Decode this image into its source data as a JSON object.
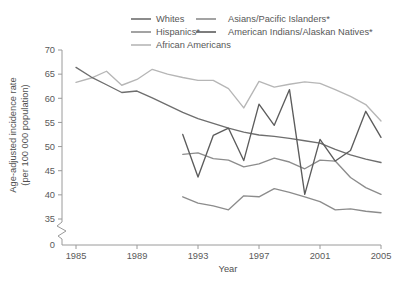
{
  "chart_data": {
    "type": "line",
    "title": "",
    "xlabel": "Year",
    "ylabel": "Age-adjusted incidence rate (per 100 000 population)",
    "ylabel_line1": "Age-adjusted incidence rate",
    "ylabel_line2": "(per 100 000 population)",
    "x": [
      1985,
      1986,
      1987,
      1988,
      1989,
      1990,
      1991,
      1992,
      1993,
      1994,
      1995,
      1996,
      1997,
      1998,
      1999,
      2000,
      2001,
      2002,
      2003,
      2004,
      2005
    ],
    "xlim": [
      1985,
      2005
    ],
    "ylim": [
      34,
      70
    ],
    "xticks": [
      1985,
      1989,
      1993,
      1997,
      2001,
      2005
    ],
    "xtick_labels": [
      "1985",
      "1989",
      "1993",
      "1997",
      "2001",
      "2005"
    ],
    "yticks": [
      35,
      40,
      45,
      50,
      55,
      60,
      65,
      70
    ],
    "ytick_labels": [
      "35",
      "40",
      "45",
      "50",
      "55",
      "60",
      "65",
      "70"
    ],
    "y_zero_label": "0",
    "axis_break": true,
    "grid": false,
    "legend_position": "top",
    "series": [
      {
        "name": "Whites",
        "color": "#6e6e6e",
        "x": [
          1985,
          1986,
          1987,
          1988,
          1989,
          1990,
          1991,
          1992,
          1993,
          1994,
          1995,
          1996,
          1997,
          1998,
          1999,
          2000,
          2001,
          2002,
          2003,
          2004,
          2005
        ],
        "values": [
          66.4,
          64.4,
          62.8,
          61.2,
          61.5,
          60.1,
          58.6,
          57.1,
          55.8,
          54.8,
          53.8,
          53.0,
          52.4,
          52.1,
          51.7,
          51.2,
          50.7,
          49.4,
          48.3,
          47.4,
          46.7
        ]
      },
      {
        "name": "African Americans",
        "color": "#b6b6b6",
        "x": [
          1985,
          1986,
          1987,
          1988,
          1989,
          1990,
          1991,
          1992,
          1993,
          1994,
          1995,
          1996,
          1997,
          1998,
          1999,
          2000,
          2001,
          2002,
          2003,
          2004,
          2005
        ],
        "values": [
          63.3,
          64.2,
          65.6,
          62.7,
          63.9,
          66.0,
          65.0,
          64.3,
          63.7,
          63.7,
          62.0,
          58.0,
          63.5,
          62.3,
          62.9,
          63.4,
          63.1,
          61.8,
          60.4,
          58.7,
          55.3
        ]
      },
      {
        "name": "Hispanics*",
        "color": "#8c8c8c",
        "x": [
          1992,
          1993,
          1994,
          1995,
          1996,
          1997,
          1998,
          1999,
          2000,
          2001,
          2002,
          2003,
          2004,
          2005
        ],
        "values": [
          48.4,
          48.7,
          47.5,
          47.2,
          45.8,
          46.4,
          47.6,
          46.8,
          45.4,
          47.2,
          47.0,
          43.6,
          41.5,
          40.1
        ]
      },
      {
        "name": "Asians/Pacific Islanders*",
        "color": "#8c8c8c",
        "x": [
          1992,
          1993,
          1994,
          1995,
          1996,
          1997,
          1998,
          1999,
          2000,
          2001,
          2002,
          2003,
          2004,
          2005
        ],
        "values": [
          39.6,
          38.3,
          37.7,
          36.9,
          39.8,
          39.6,
          41.3,
          40.5,
          39.6,
          38.6,
          36.9,
          37.1,
          36.6,
          36.3
        ]
      },
      {
        "name": "American Indians/Alaskan Natives*",
        "color": "#5c5c5c",
        "x": [
          1992,
          1993,
          1994,
          1995,
          1996,
          1997,
          1998,
          1999,
          2000,
          2001,
          2002,
          2003,
          2004,
          2005
        ],
        "values": [
          52.5,
          43.7,
          52.3,
          53.8,
          47.1,
          58.8,
          54.4,
          61.8,
          40.1,
          51.5,
          47.0,
          49.2,
          57.3,
          51.9
        ]
      }
    ]
  },
  "legend": {
    "items": [
      {
        "label": "Whites",
        "color": "#6e6e6e"
      },
      {
        "label": "Asians/Pacific Islanders*",
        "color": "#8c8c8c"
      },
      {
        "label": "Hispanics*",
        "color": "#8c8c8c"
      },
      {
        "label": "American Indians/Alaskan Natives*",
        "color": "#5c5c5c"
      },
      {
        "label": "African Americans",
        "color": "#b6b6b6"
      }
    ]
  }
}
